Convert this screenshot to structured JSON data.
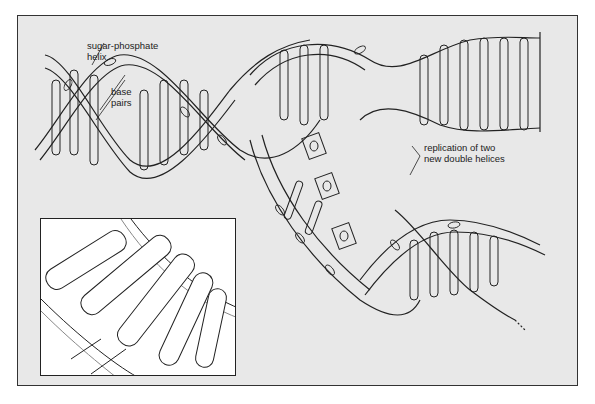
{
  "figure": {
    "labels": {
      "sugar_phosphate": "sugar-phosphate\nhelix",
      "sugar_phosphate_line1": "sugar-phosphate",
      "sugar_phosphate_line2": "helix",
      "base_pairs_line1": "base",
      "base_pairs_line2": "pairs",
      "replication_line1": "replication of two",
      "replication_line2": "new double helices"
    },
    "inset": {
      "description": "close-up of base pairs along sugar-phosphate backbone"
    },
    "colors": {
      "background": "#e8e8e8",
      "stroke": "#222222",
      "fill": "#ffffff",
      "page": "#ffffff"
    }
  }
}
